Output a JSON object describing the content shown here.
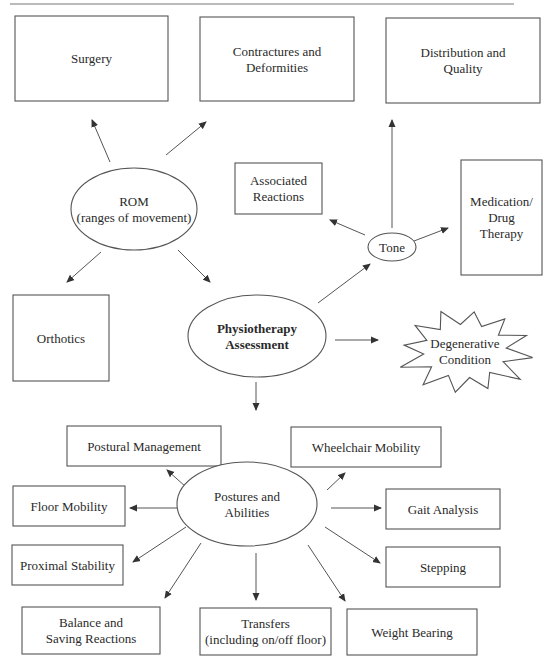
{
  "diagram": {
    "colors": {
      "stroke": "#555555",
      "text": "#2a2a2a",
      "background": "#ffffff"
    },
    "nodes": {
      "surgery": {
        "shape": "rect",
        "lines": [
          "Surgery"
        ]
      },
      "contractures": {
        "shape": "rect",
        "lines": [
          "Contractures and",
          "Deformities"
        ]
      },
      "distribution": {
        "shape": "rect",
        "lines": [
          "Distribution and",
          "Quality"
        ]
      },
      "rom": {
        "shape": "ellipse",
        "lines": [
          "ROM",
          "(ranges of movement)"
        ]
      },
      "associated": {
        "shape": "rect",
        "lines": [
          "Associated",
          "Reactions"
        ]
      },
      "medication": {
        "shape": "rect",
        "lines": [
          "Medication/",
          "Drug",
          "Therapy"
        ]
      },
      "tone": {
        "shape": "ellipse",
        "lines": [
          "Tone"
        ]
      },
      "orthotics": {
        "shape": "rect",
        "lines": [
          "Orthotics"
        ]
      },
      "physio": {
        "shape": "ellipse",
        "bold": true,
        "lines": [
          "Physiotherapy",
          "Assessment"
        ]
      },
      "degenerative": {
        "shape": "starburst",
        "lines": [
          "Degenerative",
          "Condition"
        ]
      },
      "postural": {
        "shape": "rect",
        "lines": [
          "Postural Management"
        ]
      },
      "wheelchair": {
        "shape": "rect",
        "lines": [
          "Wheelchair Mobility"
        ]
      },
      "postures": {
        "shape": "ellipse",
        "lines": [
          "Postures and",
          "Abilities"
        ]
      },
      "floor": {
        "shape": "rect",
        "lines": [
          "Floor Mobility"
        ]
      },
      "gait": {
        "shape": "rect",
        "lines": [
          "Gait Analysis"
        ]
      },
      "proximal": {
        "shape": "rect",
        "lines": [
          "Proximal Stability"
        ]
      },
      "stepping": {
        "shape": "rect",
        "lines": [
          "Stepping"
        ]
      },
      "balance": {
        "shape": "rect",
        "lines": [
          "Balance and",
          "Saving Reactions"
        ]
      },
      "transfers": {
        "shape": "rect",
        "lines": [
          "Transfers",
          "(including on/off floor)"
        ]
      },
      "weight": {
        "shape": "rect",
        "lines": [
          "Weight Bearing"
        ]
      }
    },
    "edges": [
      {
        "from": "rom",
        "to": "surgery"
      },
      {
        "from": "rom",
        "to": "contractures"
      },
      {
        "from": "rom",
        "to": "orthotics"
      },
      {
        "from": "rom",
        "to": "physio"
      },
      {
        "from": "physio",
        "to": "tone"
      },
      {
        "from": "physio",
        "to": "degenerative"
      },
      {
        "from": "physio",
        "to": "postures"
      },
      {
        "from": "tone",
        "to": "associated"
      },
      {
        "from": "tone",
        "to": "distribution"
      },
      {
        "from": "tone",
        "to": "medication"
      },
      {
        "from": "postures",
        "to": "postural"
      },
      {
        "from": "postures",
        "to": "wheelchair"
      },
      {
        "from": "postures",
        "to": "floor"
      },
      {
        "from": "postures",
        "to": "gait"
      },
      {
        "from": "postures",
        "to": "proximal"
      },
      {
        "from": "postures",
        "to": "stepping"
      },
      {
        "from": "postures",
        "to": "balance"
      },
      {
        "from": "postures",
        "to": "transfers"
      },
      {
        "from": "postures",
        "to": "weight"
      }
    ]
  }
}
